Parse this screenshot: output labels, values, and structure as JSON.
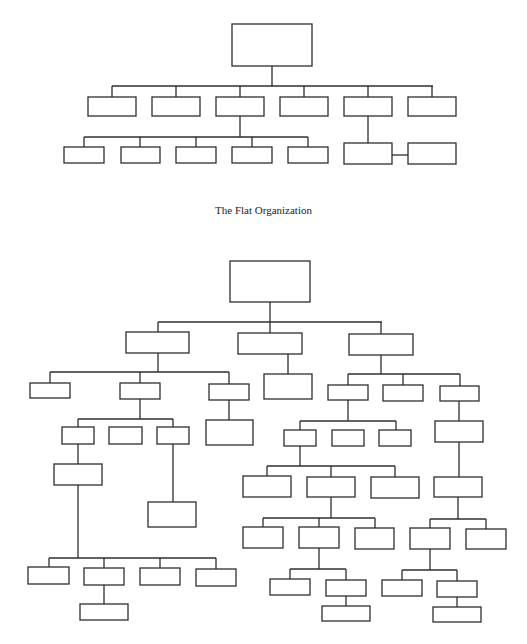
{
  "diagram": {
    "title_flat": "The Flat Organization",
    "line_color": "#2e2e2e",
    "background": "#ffffff",
    "flat": {
      "boxes": [
        {
          "id": "f0",
          "x": 232,
          "y": 24,
          "w": 80,
          "h": 42
        },
        {
          "id": "f1",
          "x": 88,
          "y": 97,
          "w": 48,
          "h": 19
        },
        {
          "id": "f2",
          "x": 152,
          "y": 97,
          "w": 48,
          "h": 19
        },
        {
          "id": "f3",
          "x": 216,
          "y": 97,
          "w": 48,
          "h": 19
        },
        {
          "id": "f4",
          "x": 280,
          "y": 97,
          "w": 48,
          "h": 19
        },
        {
          "id": "f5",
          "x": 344,
          "y": 97,
          "w": 48,
          "h": 19
        },
        {
          "id": "f6",
          "x": 408,
          "y": 97,
          "w": 48,
          "h": 19
        },
        {
          "id": "f7",
          "x": 64,
          "y": 147,
          "w": 40,
          "h": 16
        },
        {
          "id": "f8",
          "x": 121,
          "y": 147,
          "w": 39,
          "h": 16
        },
        {
          "id": "f9",
          "x": 176,
          "y": 147,
          "w": 40,
          "h": 16
        },
        {
          "id": "f10",
          "x": 232,
          "y": 147,
          "w": 40,
          "h": 16
        },
        {
          "id": "f11",
          "x": 288,
          "y": 147,
          "w": 40,
          "h": 16
        },
        {
          "id": "f12",
          "x": 344,
          "y": 143,
          "w": 48,
          "h": 21
        },
        {
          "id": "f13",
          "x": 408,
          "y": 143,
          "w": 48,
          "h": 21
        }
      ],
      "lines": [
        [
          272,
          66,
          272,
          86
        ],
        [
          112,
          86,
          433,
          86
        ],
        [
          112,
          86,
          112,
          97
        ],
        [
          176,
          86,
          176,
          97
        ],
        [
          240,
          86,
          240,
          97
        ],
        [
          304,
          86,
          304,
          97
        ],
        [
          368,
          86,
          368,
          97
        ],
        [
          432,
          86,
          432,
          97
        ],
        [
          240,
          116,
          240,
          137
        ],
        [
          84,
          137,
          308,
          137
        ],
        [
          84,
          137,
          84,
          147
        ],
        [
          140,
          137,
          140,
          147
        ],
        [
          196,
          137,
          196,
          147
        ],
        [
          252,
          137,
          252,
          147
        ],
        [
          308,
          137,
          308,
          147
        ],
        [
          368,
          116,
          368,
          143
        ],
        [
          392,
          155,
          408,
          155
        ]
      ]
    },
    "tall": {
      "boxes": [
        {
          "id": "t0",
          "x": 230,
          "y": 261,
          "w": 80,
          "h": 41
        },
        {
          "id": "t1",
          "x": 126,
          "y": 332,
          "w": 63,
          "h": 21
        },
        {
          "id": "t2",
          "x": 238,
          "y": 333,
          "w": 64,
          "h": 21
        },
        {
          "id": "t3",
          "x": 349,
          "y": 334,
          "w": 64,
          "h": 21
        },
        {
          "id": "t4",
          "x": 30,
          "y": 383,
          "w": 40,
          "h": 15
        },
        {
          "id": "t5",
          "x": 120,
          "y": 383,
          "w": 40,
          "h": 16
        },
        {
          "id": "t6",
          "x": 209,
          "y": 384,
          "w": 40,
          "h": 16
        },
        {
          "id": "t7",
          "x": 264,
          "y": 374,
          "w": 48,
          "h": 25
        },
        {
          "id": "t8",
          "x": 328,
          "y": 385,
          "w": 40,
          "h": 15
        },
        {
          "id": "t9",
          "x": 383,
          "y": 385,
          "w": 40,
          "h": 16
        },
        {
          "id": "t10",
          "x": 440,
          "y": 386,
          "w": 39,
          "h": 15
        },
        {
          "id": "t11",
          "x": 62,
          "y": 427,
          "w": 32,
          "h": 17
        },
        {
          "id": "t12",
          "x": 109,
          "y": 427,
          "w": 33,
          "h": 17
        },
        {
          "id": "t13",
          "x": 157,
          "y": 427,
          "w": 32,
          "h": 17
        },
        {
          "id": "t14",
          "x": 206,
          "y": 420,
          "w": 47,
          "h": 25
        },
        {
          "id": "t15",
          "x": 284,
          "y": 430,
          "w": 32,
          "h": 16
        },
        {
          "id": "t16",
          "x": 332,
          "y": 430,
          "w": 32,
          "h": 16
        },
        {
          "id": "t17",
          "x": 379,
          "y": 430,
          "w": 32,
          "h": 16
        },
        {
          "id": "t18",
          "x": 435,
          "y": 421,
          "w": 48,
          "h": 21
        },
        {
          "id": "t19",
          "x": 54,
          "y": 464,
          "w": 48,
          "h": 21
        },
        {
          "id": "t20",
          "x": 148,
          "y": 502,
          "w": 48,
          "h": 25
        },
        {
          "id": "t21",
          "x": 243,
          "y": 476,
          "w": 48,
          "h": 21
        },
        {
          "id": "t22",
          "x": 307,
          "y": 477,
          "w": 48,
          "h": 20
        },
        {
          "id": "t23",
          "x": 371,
          "y": 477,
          "w": 48,
          "h": 21
        },
        {
          "id": "t24",
          "x": 434,
          "y": 477,
          "w": 48,
          "h": 20
        },
        {
          "id": "t25",
          "x": 243,
          "y": 527,
          "w": 40,
          "h": 21
        },
        {
          "id": "t26",
          "x": 299,
          "y": 527,
          "w": 40,
          "h": 21
        },
        {
          "id": "t27",
          "x": 355,
          "y": 528,
          "w": 39,
          "h": 21
        },
        {
          "id": "t28",
          "x": 410,
          "y": 528,
          "w": 40,
          "h": 21
        },
        {
          "id": "t29",
          "x": 466,
          "y": 529,
          "w": 40,
          "h": 20
        },
        {
          "id": "t30",
          "x": 28,
          "y": 567,
          "w": 41,
          "h": 17
        },
        {
          "id": "t31",
          "x": 84,
          "y": 568,
          "w": 40,
          "h": 17
        },
        {
          "id": "t32",
          "x": 140,
          "y": 568,
          "w": 40,
          "h": 17
        },
        {
          "id": "t33",
          "x": 196,
          "y": 569,
          "w": 40,
          "h": 17
        },
        {
          "id": "t34",
          "x": 270,
          "y": 579,
          "w": 40,
          "h": 16
        },
        {
          "id": "t35",
          "x": 326,
          "y": 580,
          "w": 40,
          "h": 16
        },
        {
          "id": "t36",
          "x": 382,
          "y": 580,
          "w": 40,
          "h": 16
        },
        {
          "id": "t37",
          "x": 437,
          "y": 581,
          "w": 40,
          "h": 16
        },
        {
          "id": "t38",
          "x": 80,
          "y": 604,
          "w": 48,
          "h": 16
        },
        {
          "id": "t39",
          "x": 322,
          "y": 606,
          "w": 48,
          "h": 15
        },
        {
          "id": "t40",
          "x": 433,
          "y": 607,
          "w": 48,
          "h": 15
        }
      ],
      "lines": [
        [
          270,
          302,
          270,
          322
        ],
        [
          158,
          322,
          382,
          322
        ],
        [
          158,
          322,
          158,
          332
        ],
        [
          270,
          322,
          270,
          333
        ],
        [
          381,
          322,
          381,
          334
        ],
        [
          158,
          353,
          158,
          372
        ],
        [
          50,
          372,
          229,
          372
        ],
        [
          50,
          372,
          50,
          383
        ],
        [
          140,
          372,
          140,
          383
        ],
        [
          229,
          372,
          229,
          384
        ],
        [
          288,
          354,
          288,
          374
        ],
        [
          381,
          355,
          381,
          374
        ],
        [
          348,
          374,
          460,
          374
        ],
        [
          348,
          374,
          348,
          385
        ],
        [
          403,
          374,
          403,
          385
        ],
        [
          460,
          374,
          460,
          386
        ],
        [
          140,
          399,
          140,
          419
        ],
        [
          78,
          419,
          173,
          419
        ],
        [
          78,
          419,
          78,
          427
        ],
        [
          173,
          419,
          173,
          427
        ],
        [
          229,
          400,
          229,
          420
        ],
        [
          348,
          400,
          348,
          421
        ],
        [
          300,
          421,
          396,
          421
        ],
        [
          300,
          421,
          300,
          430
        ],
        [
          396,
          421,
          396,
          430
        ],
        [
          459,
          401,
          459,
          421
        ],
        [
          78,
          444,
          78,
          464
        ],
        [
          173,
          444,
          173,
          502
        ],
        [
          78,
          485,
          78,
          558
        ],
        [
          49,
          558,
          216,
          558
        ],
        [
          49,
          558,
          49,
          567
        ],
        [
          104,
          558,
          104,
          568
        ],
        [
          160,
          558,
          160,
          568
        ],
        [
          216,
          558,
          216,
          569
        ],
        [
          104,
          585,
          104,
          604
        ],
        [
          300,
          446,
          300,
          466
        ],
        [
          267,
          466,
          395,
          466
        ],
        [
          267,
          466,
          267,
          476
        ],
        [
          331,
          466,
          331,
          477
        ],
        [
          395,
          466,
          395,
          477
        ],
        [
          459,
          442,
          459,
          477
        ],
        [
          331,
          497,
          331,
          518
        ],
        [
          263,
          518,
          375,
          518
        ],
        [
          263,
          518,
          263,
          527
        ],
        [
          319,
          518,
          319,
          527
        ],
        [
          375,
          518,
          375,
          528
        ],
        [
          458,
          497,
          458,
          519
        ],
        [
          430,
          519,
          486,
          519
        ],
        [
          430,
          519,
          430,
          528
        ],
        [
          486,
          519,
          486,
          529
        ],
        [
          319,
          548,
          319,
          569
        ],
        [
          290,
          569,
          346,
          569
        ],
        [
          290,
          569,
          290,
          579
        ],
        [
          346,
          569,
          346,
          580
        ],
        [
          346,
          596,
          346,
          606
        ],
        [
          430,
          549,
          430,
          570
        ],
        [
          402,
          570,
          457,
          570
        ],
        [
          402,
          570,
          402,
          580
        ],
        [
          457,
          570,
          457,
          581
        ],
        [
          457,
          597,
          457,
          607
        ]
      ]
    }
  }
}
